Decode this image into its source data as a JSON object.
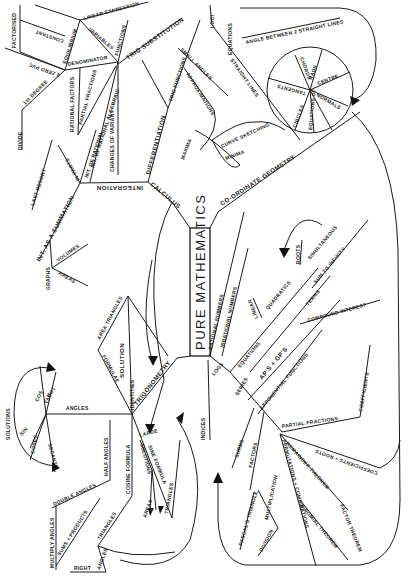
{
  "title": "PURE MATHEMATICS",
  "branches": {
    "algebra": [
      "FACTORISED",
      "CONSTANT",
      "2 ZERO PVC",
      "1st DEGREE",
      "EQUILIBRIUM",
      "DENOMINATOR",
      "LINEAR EXPRESSION",
      "VARIABLES",
      "FUNCTIONS",
      "RATIONAL FACTORS",
      "PARTIAL FRACTIONS",
      "INT. OF RATIONAL ALGEBRAIC",
      "CHANGES OF VARIANT",
      "DIVIDE",
      "LAST RESORT",
      "IN PARTS",
      "INT. OF RATIONAL"
    ],
    "calculus": [
      "CALCULUS",
      "INTEGRATION",
      "DIFFERENTIATION",
      "TRIG SUBSTITUTION",
      "TRIG FUNCTIONS",
      "INT. AS A SUMMATION",
      "VOLUMES",
      "AREAS",
      "GRAPHS",
      "SMALL ANGLES",
      "APPROXIMATIONS",
      "CURVE SKETCHING",
      "MINIMA",
      "MAXIMA"
    ],
    "coordinate_geometry": [
      "CO-ORDINATE GEOMETRY",
      "LOCI",
      "EQUATIONS",
      "ANGLE BETWEEN 2 STRAIGHT LINES",
      "STRAIGHT LINES",
      "CIRCLES",
      "CENTRE",
      "RADII",
      "CHORDS",
      "TANGENTS",
      "NORMALS",
      "EQUATIONS OF"
    ],
    "numbers": [
      "RATIONAL NUMBERS",
      "IRRATIONAL NUMBERS",
      "INDICES",
      "LOGS"
    ],
    "equations": [
      "EQUATIONS",
      "LINEAR",
      "QUADRATICS",
      "ROOTS",
      "SIMULTANEOUS",
      "SUM TO INFINITY",
      "TERMS",
      "AP'S + GP'S",
      "COMPOUND INTEREST",
      "EXPONENTIAL FUNCTIONS",
      "SERIES"
    ],
    "polynomials": [
      "PARTIAL FRACTIONS",
      "COEFFICIENTS",
      "COEFFICIENTS + ROOTS",
      "REMAINDER THEOREM",
      "FACTOR THEOREM",
      "SURDS",
      "FACTORS",
      "MULTIPLICATION",
      "DIVISION",
      "PASCAL'S TRIANGLE",
      "BINOMIAL THEOREM",
      "PERMUTATIONS + COMBINATIONS",
      "BINOMIAL"
    ],
    "trigonometry": [
      "TRIGONOMETRY",
      "IDENTITIES",
      "SOLUTION",
      "AREA TRIANGLES",
      "FORMULAE",
      "ANGLES",
      "SIN",
      "COS",
      "TAN",
      "COSEC",
      "SECANT",
      "COT",
      "SOLUTIONS",
      "COSINE FORMULA",
      "HALF ANGLES",
      "DOUBLE ANGLES",
      "MULTIPLY ANGLES",
      "SUMS + PRODUCTS",
      "TRIANGLES",
      "RIGHT",
      "ANGLES",
      "SINE FORMULA",
      "SOLUTIONS",
      "AREAS",
      "LARGE"
    ]
  }
}
